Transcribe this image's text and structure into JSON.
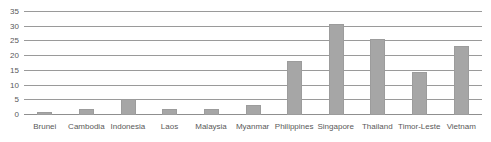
{
  "chart_data": {
    "type": "bar",
    "title": "",
    "subtitle": "",
    "xlabel": "",
    "ylabel": "",
    "ylim": [
      0,
      35
    ],
    "yticks": [
      0,
      5,
      10,
      15,
      20,
      25,
      30,
      35
    ],
    "ytick_labels": [
      "0",
      "5",
      "10",
      "15",
      "20",
      "25",
      "30",
      "35"
    ],
    "grid": true,
    "legend": false,
    "legend_position": "none",
    "bar_color": "#a6a6a6",
    "gridline_color": "#9a9a9a",
    "axis_text_color": "#595959",
    "background_color": "#ffffff",
    "categories": [
      "Brunei",
      "Cambodia",
      "Indonesia",
      "Laos",
      "Malaysia",
      "Myanmar",
      "Philippines",
      "Singapore",
      "Thailand",
      "Timor-Leste",
      "Vietnam"
    ],
    "values": [
      1,
      2,
      5.5,
      2,
      2,
      3.5,
      18.5,
      31,
      26,
      14.5,
      23.5
    ]
  }
}
